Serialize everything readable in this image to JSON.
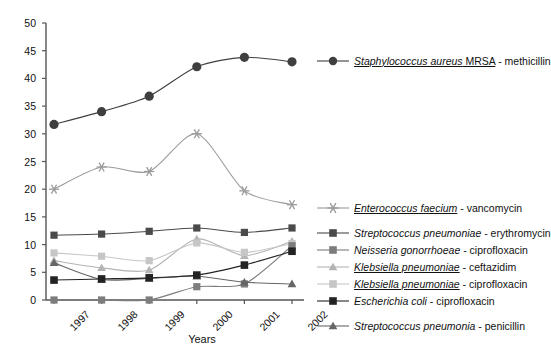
{
  "chart_data": {
    "type": "line",
    "title": "",
    "xlabel": "Years",
    "ylabel": "",
    "categories": [
      "1997",
      "1998",
      "1999",
      "2000",
      "2001",
      "2002"
    ],
    "ylim": [
      0,
      50
    ],
    "yticks": [
      0,
      5,
      10,
      15,
      20,
      25,
      30,
      35,
      40,
      45,
      50
    ],
    "grid": false,
    "legend_position": "right",
    "series": [
      {
        "name": "Staphylococcus aureus MRSA - methicillin",
        "organism": "Staphylococcus aureus MRSA",
        "antibiotic": "methicillin",
        "marker": "circle",
        "color": "#3f3f3f",
        "values": [
          31.7,
          34.0,
          36.8,
          42.1,
          43.8,
          43.0
        ]
      },
      {
        "name": "Enterococcus faecium - vancomycin",
        "organism": "Enterococcus faecium",
        "antibiotic": "vancomycin",
        "marker": "asterisk",
        "color": "#9a9a9a",
        "values": [
          20.0,
          24.0,
          23.2,
          30.0,
          19.7,
          17.2
        ]
      },
      {
        "name": "Streptococcus pneumoniae - erythromycin",
        "organism": "Streptococcus pneumoniae",
        "antibiotic": "erythromycin",
        "marker": "square",
        "color": "#4a4a4a",
        "values": [
          11.7,
          11.9,
          12.4,
          13.0,
          12.2,
          13.0
        ]
      },
      {
        "name": "Neisseria gonorrhoeae - ciprofloxacin",
        "organism": "Neisseria gonorrhoeae",
        "antibiotic": "ciprofloxacin",
        "marker": "square",
        "color": "#7d7d7d",
        "values": [
          0.0,
          0.0,
          0.0,
          2.4,
          2.9,
          9.8
        ]
      },
      {
        "name": "Klebsiella pneumoniae - ceftazidim",
        "organism": "Klebsiella pneumoniae",
        "antibiotic": "ceftazidim",
        "marker": "triangle",
        "color": "#b4b4b4",
        "values": [
          7.1,
          5.8,
          5.4,
          11.0,
          8.0,
          10.6
        ]
      },
      {
        "name": "Klebsiella pneumoniae - ciprofloxacin",
        "organism": "Klebsiella pneumoniae",
        "antibiotic": "ciprofloxacin",
        "marker": "square",
        "color": "#c6c6c6",
        "values": [
          8.5,
          7.9,
          7.1,
          10.3,
          8.6,
          10.2
        ]
      },
      {
        "name": "Escherichia coli - ciprofloxacin",
        "organism": "Escherichia coli",
        "antibiotic": "ciprofloxacin",
        "marker": "square",
        "color": "#232323",
        "values": [
          3.6,
          3.8,
          4.0,
          4.5,
          6.3,
          8.8
        ]
      },
      {
        "name": "Streptococcus pneumonia - penicillin",
        "organism": "Streptococcus pneumonia",
        "antibiotic": "penicillin",
        "marker": "triangle",
        "color": "#666666",
        "values": [
          6.7,
          3.7,
          3.9,
          4.3,
          3.2,
          2.9
        ]
      }
    ]
  },
  "axis": {
    "x_title": "Years"
  },
  "legend": {
    "top_entries": [
      {
        "organism": "Staphylococcus aureus MRSA",
        "organism_italic_part": "Staphylococcus aureus",
        "organism_plain_part": " MRSA",
        "separator": " - ",
        "antibiotic": "methicillin",
        "marker": "circle",
        "color": "#3f3f3f",
        "underline": true
      }
    ],
    "bottom_entries": [
      {
        "organism_italic_part": "Enterococcus faecium",
        "organism_plain_part": "",
        "separator": " - ",
        "antibiotic": "vancomycin",
        "marker": "asterisk",
        "color": "#9a9a9a",
        "underline": true
      },
      {
        "organism_italic_part": "Streptococcus pneumoniae",
        "organism_plain_part": "",
        "separator": " - ",
        "antibiotic": "erythromycin",
        "marker": "square",
        "color": "#4a4a4a",
        "underline": false
      },
      {
        "organism_italic_part": "Neisseria gonorrhoeae",
        "organism_plain_part": "",
        "separator": " - ",
        "antibiotic": "ciprofloxacin",
        "marker": "square",
        "color": "#7d7d7d",
        "underline": false
      },
      {
        "organism_italic_part": "Klebsiella pneumoniae",
        "organism_plain_part": "",
        "separator": " - ",
        "antibiotic": "ceftazidim",
        "marker": "triangle",
        "color": "#b4b4b4",
        "underline": true
      },
      {
        "organism_italic_part": "Klebsiella pneumoniae",
        "organism_plain_part": "",
        "separator": " - ",
        "antibiotic": "ciprofloxacin",
        "marker": "square",
        "color": "#c6c6c6",
        "underline": true
      },
      {
        "organism_italic_part": "Escherichia coli",
        "organism_plain_part": "",
        "separator": " - ",
        "antibiotic": "ciprofloxacin",
        "marker": "square",
        "color": "#232323",
        "underline": false
      },
      {
        "organism_italic_part": "Streptococcus pneumonia",
        "organism_plain_part": "",
        "separator": " - ",
        "antibiotic": "penicillin",
        "marker": "triangle",
        "color": "#666666",
        "underline": false
      }
    ]
  }
}
